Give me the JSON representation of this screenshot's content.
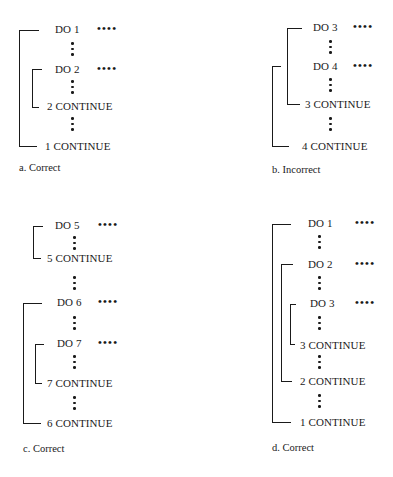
{
  "panels": {
    "a": {
      "caption": "a. Correct",
      "lines": {
        "do1": "DO 1",
        "do2": "DO 2",
        "cont2": "2 CONTINUE",
        "cont1": "1 CONTINUE"
      },
      "ellipsis": "••••",
      "nesting": [
        {
          "loop": "1",
          "contains": [
            "2"
          ]
        }
      ]
    },
    "b": {
      "caption": "b. Incorrect",
      "lines": {
        "do3": "DO 3",
        "do4": "DO 4",
        "cont3": "3 CONTINUE",
        "cont4": "4 CONTINUE"
      },
      "ellipsis": "••••",
      "nesting": [
        {
          "loop": "3",
          "overlaps": "4"
        }
      ]
    },
    "c": {
      "caption": "c. Correct",
      "lines": {
        "do5": "DO 5",
        "cont5": "5 CONTINUE",
        "do6": "DO 6",
        "do7": "DO 7",
        "cont7": "7 CONTINUE",
        "cont6": "6 CONTINUE"
      },
      "ellipsis": "••••",
      "nesting": [
        {
          "loop": "5",
          "contains": []
        },
        {
          "loop": "6",
          "contains": [
            "7"
          ]
        }
      ]
    },
    "d": {
      "caption": "d. Correct",
      "lines": {
        "do1": "DO 1",
        "do2": "DO 2",
        "do3": "DO 3",
        "cont3": "3 CONTINUE",
        "cont2": "2 CONTINUE",
        "cont1": "1 CONTINUE"
      },
      "ellipsis": "••••",
      "nesting": [
        {
          "loop": "1",
          "contains": [
            "2"
          ]
        },
        {
          "loop": "2",
          "contains": [
            "3"
          ]
        }
      ]
    }
  }
}
